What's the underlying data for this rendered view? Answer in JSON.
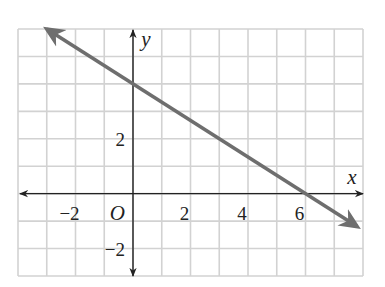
{
  "chart_data": {
    "type": "line",
    "title": "",
    "xlabel": "x",
    "ylabel": "y",
    "origin_label": "O",
    "xlim": [
      -4,
      8
    ],
    "ylim": [
      -3,
      6
    ],
    "grid": true,
    "legend": null,
    "x_tick_labels": [
      {
        "value": -2,
        "text": "−2"
      },
      {
        "value": 2,
        "text": "2"
      },
      {
        "value": 4,
        "text": "4"
      },
      {
        "value": 6,
        "text": "6"
      }
    ],
    "y_tick_labels": [
      {
        "value": 2,
        "text": "2"
      },
      {
        "value": -2,
        "text": "−2"
      }
    ],
    "series": [
      {
        "name": "line",
        "equation": "y = -2/3 x + 4",
        "slope": -0.6667,
        "y_intercept": 4,
        "x_intercept": 6,
        "x": [
          -3,
          0,
          3,
          6,
          7.8
        ],
        "y": [
          6,
          4,
          2,
          0,
          -1.2
        ],
        "arrows_both_ends": true,
        "color": "#6e6e6e"
      }
    ],
    "colors": {
      "grid": "#d2d2d2",
      "axes": "#222222",
      "line": "#6e6e6e"
    }
  }
}
